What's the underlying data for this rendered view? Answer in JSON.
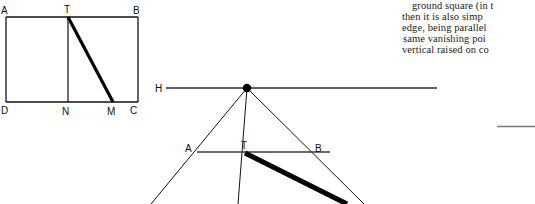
{
  "page": {
    "width": 535,
    "height": 204,
    "background": "#ffffff",
    "ink_color": "#111111",
    "faint_rule_color": "#7a7a7a"
  },
  "figure_top_left": {
    "name": "elevation-rectangle-diagram",
    "description": "Rectangle ABCD with vertical TN and diagonal TM drawn heavy",
    "labels": [
      {
        "id": "A",
        "text": "A",
        "x": 1,
        "y": 6
      },
      {
        "id": "T",
        "text": "T",
        "x": 64,
        "y": 5
      },
      {
        "id": "B",
        "text": "B",
        "x": 133,
        "y": 6
      },
      {
        "id": "D",
        "text": "D",
        "x": 1,
        "y": 106
      },
      {
        "id": "N",
        "text": "N",
        "x": 62,
        "y": 107
      },
      {
        "id": "M",
        "text": "M",
        "x": 107,
        "y": 107
      },
      {
        "id": "C",
        "text": "C",
        "x": 130,
        "y": 106
      }
    ],
    "points": {
      "A": [
        6,
        17
      ],
      "B": [
        138,
        17
      ],
      "C": [
        138,
        102
      ],
      "D": [
        6,
        102
      ],
      "T": [
        68,
        17
      ],
      "N": [
        68,
        102
      ],
      "M": [
        113,
        102
      ]
    },
    "segments": [
      {
        "name": "top-edge-AB",
        "from": "A",
        "to": "B",
        "weight": "thin"
      },
      {
        "name": "right-edge-BC",
        "from": "B",
        "to": "C",
        "weight": "thin"
      },
      {
        "name": "bottom-edge-DC",
        "from": "D",
        "to": "C",
        "weight": "thin"
      },
      {
        "name": "left-edge-AD",
        "from": "A",
        "to": "D",
        "weight": "thin"
      },
      {
        "name": "vertical-TN",
        "from": "T",
        "to": "N",
        "weight": "thin"
      },
      {
        "name": "diagonal-TM",
        "from": "T",
        "to": "M",
        "weight": "heavy"
      }
    ]
  },
  "figure_perspective": {
    "name": "perspective-vanishing-point-diagram",
    "description": "Horizon line H with vanishing point, converging rays, ground line A-T-B and heavy diagonal",
    "labels": [
      {
        "id": "H",
        "text": "H",
        "x": 155,
        "y": 84
      },
      {
        "id": "A",
        "text": "A",
        "x": 185,
        "y": 144
      },
      {
        "id": "T",
        "text": "T",
        "x": 241,
        "y": 141
      },
      {
        "id": "B",
        "text": "B",
        "x": 315,
        "y": 144
      }
    ],
    "points": {
      "V": [
        247,
        88
      ],
      "A": [
        197,
        152
      ],
      "T": [
        245,
        152
      ],
      "B": [
        330,
        152
      ],
      "horizon_left": [
        166,
        88
      ],
      "horizon_right": [
        437,
        88
      ]
    },
    "segments": [
      {
        "name": "horizon-line",
        "from": "horizon_left",
        "to": "horizon_right",
        "weight": "thin"
      },
      {
        "name": "ray-left-outer",
        "from": "V",
        "to": [
          152,
          204
        ],
        "weight": "thin"
      },
      {
        "name": "ray-right-outer",
        "from": "V",
        "to": [
          363,
          204
        ],
        "weight": "thin"
      },
      {
        "name": "ray-center-vertical",
        "from": "V",
        "to": [
          238,
          204
        ],
        "weight": "thin"
      },
      {
        "name": "ground-line-AB",
        "from": "A",
        "to": "B",
        "weight": "thin"
      },
      {
        "name": "heavy-diagonal-T",
        "from": [
          245,
          153
        ],
        "to": [
          345,
          204
        ],
        "weight": "heavy"
      }
    ],
    "vanishing_point_dot": {
      "cx": 247,
      "cy": 88,
      "r": 4
    }
  },
  "body_text": {
    "name": "book-text-column",
    "note": "right-hand body text clipped by the screenshot edge",
    "lines": [
      "ground square (in t",
      "then it is also simp",
      "edge, being parallel",
      "same vanishing poi",
      "vertical raised on co"
    ]
  },
  "faint_rule": {
    "name": "faint-horizontal-rule",
    "x": 497,
    "y": 126,
    "width": 38,
    "height": 2
  }
}
